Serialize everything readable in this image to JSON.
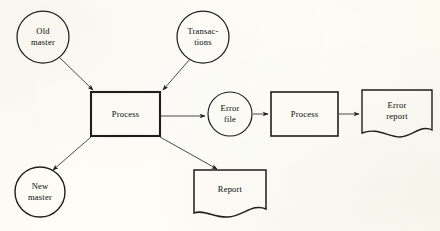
{
  "figure": {
    "kind": "data-flow-diagram",
    "background_color": "#fdfcf4",
    "ink_color": "#1e1e1e"
  },
  "nodes": {
    "old_master": {
      "label": "Old\nmaster",
      "shape": "circle",
      "cx": 43,
      "cy": 37,
      "r": 26
    },
    "transactions": {
      "label": "Transac-\ntions",
      "shape": "circle",
      "cx": 203,
      "cy": 37,
      "r": 26
    },
    "process_main": {
      "label": "Process",
      "shape": "rectangle",
      "x": 91,
      "y": 92,
      "w": 69,
      "h": 44
    },
    "error_file": {
      "label": "Error\nfile",
      "shape": "circle",
      "cx": 230,
      "cy": 114,
      "r": 22
    },
    "process_error": {
      "label": "Process",
      "shape": "rectangle",
      "x": 271,
      "y": 92,
      "w": 67,
      "h": 44
    },
    "error_report": {
      "label": "Error\nreport",
      "shape": "document",
      "x": 362,
      "y": 90,
      "w": 70,
      "h": 48
    },
    "new_master": {
      "label": "New\nmaster",
      "shape": "circle",
      "cx": 40,
      "cy": 192,
      "r": 25
    },
    "report": {
      "label": "Report",
      "shape": "document",
      "x": 194,
      "y": 170,
      "w": 72,
      "h": 48
    }
  },
  "edges": [
    {
      "name": "old-master-to-process",
      "from": "old_master",
      "to": "process_main"
    },
    {
      "name": "transactions-to-process",
      "from": "transactions",
      "to": "process_main"
    },
    {
      "name": "process-to-error-file",
      "from": "process_main",
      "to": "error_file"
    },
    {
      "name": "error-file-to-process-error",
      "from": "error_file",
      "to": "process_error"
    },
    {
      "name": "process-error-to-error-report",
      "from": "process_error",
      "to": "error_report"
    },
    {
      "name": "process-to-new-master",
      "from": "process_main",
      "to": "new_master"
    },
    {
      "name": "process-to-report",
      "from": "process_main",
      "to": "report"
    }
  ]
}
